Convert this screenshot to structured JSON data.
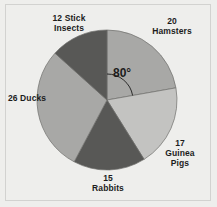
{
  "figure": {
    "background_color": "#eeeeec",
    "frame_color": "#d2d2d0"
  },
  "chart_data": {
    "type": "pie",
    "title": "",
    "xlabel": "",
    "ylabel": "",
    "total": 90,
    "start_angle_deg": 0,
    "direction": "clockwise",
    "center": {
      "x": 107,
      "y": 100
    },
    "radius": 70,
    "categories": [
      "Hamsters",
      "Guinea Pigs",
      "Rabbits",
      "Ducks",
      "Stick Insects"
    ],
    "values": [
      20,
      17,
      15,
      26,
      12
    ],
    "angles_deg": [
      80,
      68,
      60,
      104,
      48
    ],
    "colors": [
      "#a8a8a6",
      "#c3c3c1",
      "#585856",
      "#a8a8a6",
      "#585856"
    ],
    "legend": "none",
    "grid": false,
    "annotations": [
      {
        "name": "sector-angle",
        "text": "80°",
        "value": 80,
        "unit": "degrees",
        "applies_to": "Hamsters"
      }
    ],
    "labels": [
      {
        "id": "stick",
        "text": "12 Stick\nInsects",
        "value": 12,
        "name": "Stick Insects"
      },
      {
        "id": "hamster",
        "text": "20\nHamsters",
        "value": 20,
        "name": "Hamsters"
      },
      {
        "id": "ducks",
        "text": "26 Ducks",
        "value": 26,
        "name": "Ducks"
      },
      {
        "id": "guinea",
        "text": "17\nGuinea\nPigs",
        "value": 17,
        "name": "Guinea Pigs"
      },
      {
        "id": "rabbits",
        "text": "15\nRabbits",
        "value": 15,
        "name": "Rabbits"
      }
    ]
  },
  "labels": {
    "stick_insects": "12 Stick\nInsects",
    "hamsters": "20\nHamsters",
    "ducks": "26 Ducks",
    "guinea_pigs": "17\nGuinea\nPigs",
    "rabbits": "15\nRabbits",
    "angle": "80°"
  }
}
